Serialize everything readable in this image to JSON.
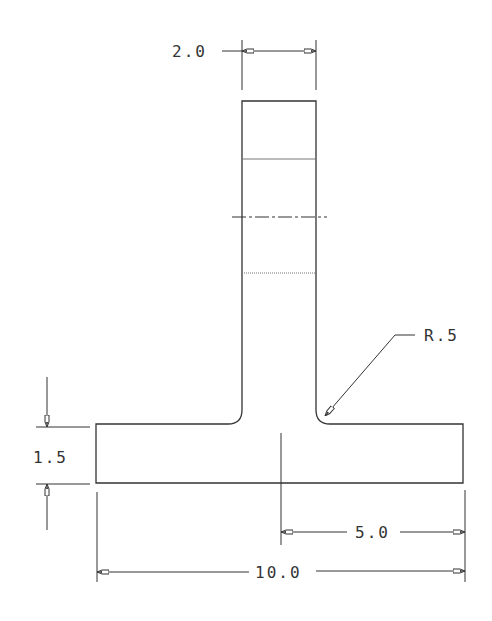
{
  "drawing": {
    "type": "T-section engineering drawing",
    "line_color": "#333333",
    "dimensions": {
      "stem_width": "2.0",
      "fillet_radius": "R.5",
      "flange_thickness": "1.5",
      "half_length": "5.0",
      "total_length": "10.0"
    }
  }
}
